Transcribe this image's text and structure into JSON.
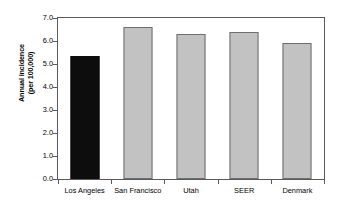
{
  "chart_data": {
    "type": "bar",
    "title": "",
    "xlabel": "",
    "ylabel": "Annual incidence\n(per 100,000)",
    "ylabel_line1": "Annual incidence",
    "ylabel_line2": "(per 100,000)",
    "categories": [
      "Los Angeles",
      "San Francisco",
      "Utah",
      "SEER",
      "Denmark"
    ],
    "values": [
      5.35,
      6.6,
      6.3,
      6.4,
      5.9
    ],
    "ylim": [
      0.0,
      7.0
    ],
    "ytick_labels": [
      "0.0",
      "1.0",
      "2.0",
      "3.0",
      "4.0",
      "5.0",
      "6.0",
      "7.0"
    ],
    "ytick_values": [
      0.0,
      1.0,
      2.0,
      3.0,
      4.0,
      5.0,
      6.0,
      7.0
    ],
    "grid": false,
    "legend": "none",
    "bar_colors": [
      "#0d0d0d",
      "#c2c2c2",
      "#c2c2c2",
      "#c2c2c2",
      "#c2c2c2"
    ],
    "highlight_category": "Los Angeles",
    "colors": {
      "highlight_fill": "#0d0d0d",
      "default_fill": "#c2c2c2",
      "bar_border": "#6e6e6e",
      "axis": "#5a5a5a",
      "background": "#ffffff",
      "text": "#000000"
    }
  }
}
